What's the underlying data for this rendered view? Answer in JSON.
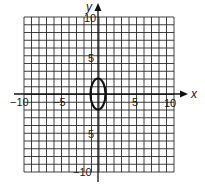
{
  "chart_data": {
    "type": "line",
    "title": "",
    "xlabel": "x",
    "ylabel": "y",
    "xlim": [
      -10,
      10
    ],
    "ylim": [
      -10,
      10
    ],
    "grid": true,
    "grid_step": 1,
    "x_tick_labels": [
      "-10",
      "-5",
      "5",
      "10"
    ],
    "x_tick_values": [
      -10,
      -5,
      5,
      10
    ],
    "y_tick_labels": [
      "10",
      "5",
      "5",
      "-10"
    ],
    "y_tick_values": [
      10,
      5,
      -5,
      -10
    ],
    "series": [
      {
        "name": "ellipse",
        "shape": "ellipse",
        "center": [
          0,
          0
        ],
        "semi_axis_x": 1,
        "semi_axis_y": 2,
        "equation": "x^2 + y^2/4 = 1"
      }
    ],
    "legend": null
  },
  "labels": {
    "x_axis": "x",
    "y_axis": "y",
    "x_neg10": "−10",
    "x_neg5": "−5",
    "x_pos5": "5",
    "x_pos10": "10",
    "y_pos10": "10",
    "y_pos5": "5",
    "y_neg5": "5",
    "y_neg10": "−10"
  },
  "colors": {
    "grid": "#2a2a2a",
    "axis": "#111111",
    "curve": "#111111",
    "background": "#ffffff"
  }
}
